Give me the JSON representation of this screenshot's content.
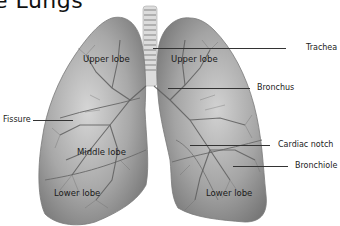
{
  "title": "e Lungs",
  "labels": {
    "trachea": "Trachea",
    "bronchus": "Bronchus",
    "fissure": "Fissure",
    "cardiac_notch": "Cardiac notch",
    "bronchiole": "Bronchiole",
    "upper_lobe_right": "Upper lobe",
    "upper_lobe_left": "Upper lobe",
    "middle_lobe": "Middle lobe",
    "lower_lobe_right": "Lower lobe",
    "lower_lobe_left": "Lower lobe"
  },
  "colors": {
    "lung_fill": "#9a9a9a",
    "lung_dark": "#7c7c7c",
    "vessel": "#5e5e5e",
    "trachea": "#d8d8d8",
    "leader": "#333333"
  }
}
